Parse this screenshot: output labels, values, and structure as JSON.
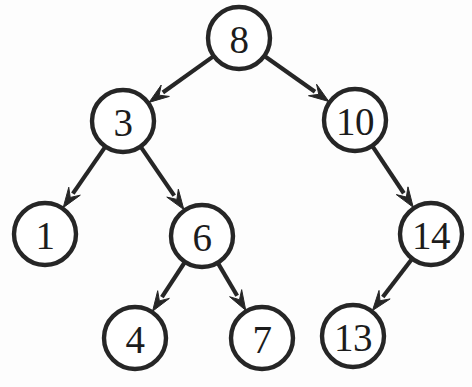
{
  "diagram": {
    "type": "binary-search-tree",
    "background_color": "#fdfdfd",
    "stroke_color": "#262626",
    "node_fill_color": "#ffffff",
    "nodes": [
      {
        "id": "n8",
        "label": "8",
        "cx": 239,
        "cy": 38,
        "r": 31
      },
      {
        "id": "n3",
        "label": "3",
        "cx": 123,
        "cy": 121,
        "r": 31
      },
      {
        "id": "n10",
        "label": "10",
        "cx": 355,
        "cy": 120,
        "r": 31
      },
      {
        "id": "n1",
        "label": "1",
        "cx": 45,
        "cy": 234,
        "r": 31
      },
      {
        "id": "n6",
        "label": "6",
        "cx": 202,
        "cy": 236,
        "r": 31
      },
      {
        "id": "n14",
        "label": "14",
        "cx": 431,
        "cy": 234,
        "r": 31
      },
      {
        "id": "n4",
        "label": "4",
        "cx": 135,
        "cy": 338,
        "r": 31
      },
      {
        "id": "n7",
        "label": "7",
        "cx": 262,
        "cy": 338,
        "r": 31
      },
      {
        "id": "n13",
        "label": "13",
        "cx": 353,
        "cy": 336,
        "r": 31
      }
    ],
    "edges": [
      {
        "id": "e8-3",
        "from": "n8",
        "to": "n3",
        "from_label": "8",
        "to_label": "3",
        "direction": "left",
        "arrow": true
      },
      {
        "id": "e8-10",
        "from": "n8",
        "to": "n10",
        "from_label": "8",
        "to_label": "10",
        "direction": "right",
        "arrow": true
      },
      {
        "id": "e3-1",
        "from": "n3",
        "to": "n1",
        "from_label": "3",
        "to_label": "1",
        "direction": "left",
        "arrow": true
      },
      {
        "id": "e3-6",
        "from": "n3",
        "to": "n6",
        "from_label": "3",
        "to_label": "6",
        "direction": "right",
        "arrow": true
      },
      {
        "id": "e10-14",
        "from": "n10",
        "to": "n14",
        "from_label": "10",
        "to_label": "14",
        "direction": "right",
        "arrow": true
      },
      {
        "id": "e6-4",
        "from": "n6",
        "to": "n4",
        "from_label": "6",
        "to_label": "4",
        "direction": "left",
        "arrow": true
      },
      {
        "id": "e6-7",
        "from": "n6",
        "to": "n7",
        "from_label": "6",
        "to_label": "7",
        "direction": "right",
        "arrow": true
      },
      {
        "id": "e14-13",
        "from": "n14",
        "to": "n13",
        "from_label": "14",
        "to_label": "13",
        "direction": "left",
        "arrow": true
      }
    ]
  }
}
